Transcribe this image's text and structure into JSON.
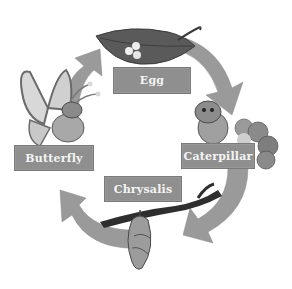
{
  "diagram": {
    "stages": [
      {
        "id": "egg",
        "label": "Egg"
      },
      {
        "id": "caterpillar",
        "label": "Caterpillar"
      },
      {
        "id": "chrysalis",
        "label": "Chrysalis"
      },
      {
        "id": "butterfly",
        "label": "Butterfly"
      }
    ],
    "flow": "clockwise",
    "colors": {
      "label_bg": "#8f8f8f",
      "label_text": "#f4f4f4",
      "arrow": "#9a9a9a",
      "leaf": "#555555",
      "branch": "#2e2e2e"
    }
  }
}
